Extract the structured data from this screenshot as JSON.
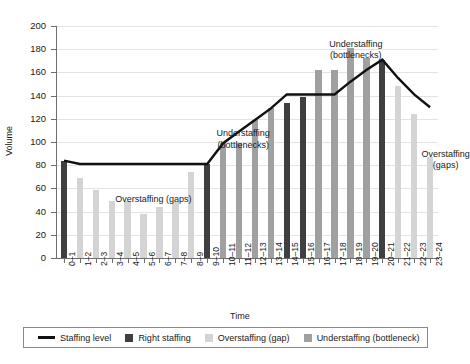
{
  "chart_data": {
    "type": "bar",
    "title": "",
    "xlabel": "Time",
    "ylabel": "Volume",
    "ylim": [
      0,
      200
    ],
    "ytick_step": 20,
    "yticks": [
      0,
      20,
      40,
      60,
      80,
      100,
      120,
      140,
      160,
      180,
      200
    ],
    "grid": true,
    "legend_position": "bottom",
    "categories": [
      "0–1",
      "1–2",
      "2–3",
      "3–4",
      "4–5",
      "5–6",
      "6–7",
      "7–8",
      "8–9",
      "9–10",
      "10–11",
      "11–12",
      "12–13",
      "13–14",
      "14–15",
      "15–16",
      "16–17",
      "17–18",
      "18–19",
      "19–20",
      "20–21",
      "21–22",
      "22–23",
      "23–24"
    ],
    "series": [
      {
        "name": "Volume",
        "values": [
          84,
          69,
          59,
          49,
          49,
          38,
          44,
          48,
          74,
          81,
          99,
          99,
          119,
          129,
          134,
          139,
          162,
          162,
          181,
          172,
          171,
          148,
          124,
          87
        ],
        "classes": [
          "right",
          "over",
          "over",
          "over",
          "over",
          "over",
          "over",
          "over",
          "over",
          "right",
          "under",
          "under",
          "under",
          "under",
          "right",
          "right",
          "under",
          "under",
          "under",
          "under",
          "right",
          "over",
          "over",
          "over"
        ]
      },
      {
        "name": "Staffing level",
        "type": "line",
        "values": [
          84,
          81,
          81,
          81,
          81,
          81,
          81,
          81,
          81,
          81,
          99,
          109,
          119,
          129,
          141,
          141,
          141,
          141,
          152,
          162,
          171,
          155,
          141,
          130
        ]
      }
    ],
    "colors": {
      "right_staffing": "#3f3f3f",
      "overstaffing": "#d4d4d4",
      "understaffing": "#a0a0a0",
      "staffing_level": "#111111",
      "gridline": "#e3e3e3",
      "axis": "#6e6e6e"
    },
    "annotations": [
      {
        "text_line1": "Overstaffing (gaps)",
        "text_line2": "",
        "x_pct": 25.5,
        "y_pct": 72.5
      },
      {
        "text_line1": "Understaffing",
        "text_line2": "(bottlenecks)",
        "x_pct": 49.0,
        "y_pct": 44.0
      },
      {
        "text_line1": "Understaffing",
        "text_line2": "(bottlenecks)",
        "x_pct": 78.5,
        "y_pct": 5.5
      },
      {
        "text_line1": "Overstaffing",
        "text_line2": "(gaps)",
        "x_pct": 102.0,
        "y_pct": 53.0
      }
    ]
  },
  "legend": {
    "items": [
      {
        "label": "Staffing level",
        "marker": "line",
        "color": "#111111"
      },
      {
        "label": "Right staffing",
        "marker": "square",
        "color": "#3f3f3f"
      },
      {
        "label": "Overstaffing (gap)",
        "marker": "square",
        "color": "#d4d4d4"
      },
      {
        "label": "Understaffing (bottleneck)",
        "marker": "square",
        "color": "#a0a0a0"
      }
    ]
  }
}
